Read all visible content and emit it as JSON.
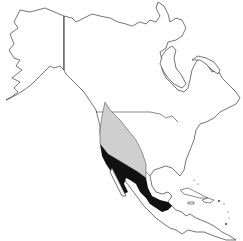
{
  "map": {
    "type": "species-range-map",
    "region": "North America",
    "legend_visible": false,
    "ranges": [
      {
        "name": "light-range",
        "color": "#cfcfcf",
        "description": "light gray shaded range (western interior US)"
      },
      {
        "name": "dark-range",
        "color": "#111111",
        "description": "black shaded range (Mexico to Central America)"
      }
    ],
    "colors": {
      "background": "#ffffff",
      "outline": "#3a3a3a"
    }
  }
}
